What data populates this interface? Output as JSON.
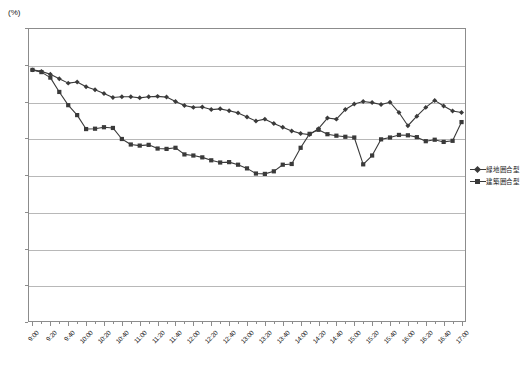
{
  "chart_data": {
    "type": "line",
    "title": "",
    "subtitle": "",
    "unit_label": "(%)",
    "xlabel": "",
    "ylabel": "",
    "ylim": [
      0.0,
      80.0
    ],
    "ytick_step": 10.0,
    "yticks": [
      "0.0",
      "10.0",
      "20.0",
      "30.0",
      "40.0",
      "50.0",
      "60.0",
      "70.0",
      "80.0"
    ],
    "grid": true,
    "grid_axis": "y",
    "legend_position": "right",
    "xtick_labels": [
      "9:00",
      "9:20",
      "9:40",
      "10:00",
      "10:20",
      "10:40",
      "11:00",
      "11:20",
      "11:40",
      "12:00",
      "12:20",
      "12:40",
      "13:00",
      "13:20",
      "13:40",
      "14:00",
      "14:20",
      "14:40",
      "15:00",
      "15:20",
      "15:40",
      "16:00",
      "16:20",
      "16:40",
      "17:00"
    ],
    "x": [
      "9:00",
      "9:10",
      "9:20",
      "9:30",
      "9:40",
      "9:50",
      "10:00",
      "10:10",
      "10:20",
      "10:30",
      "10:40",
      "10:50",
      "11:00",
      "11:10",
      "11:20",
      "11:30",
      "11:40",
      "11:50",
      "12:00",
      "12:10",
      "12:20",
      "12:30",
      "12:40",
      "12:50",
      "13:00",
      "13:10",
      "13:20",
      "13:30",
      "13:40",
      "13:50",
      "14:00",
      "14:10",
      "14:20",
      "14:30",
      "14:40",
      "14:50",
      "15:00",
      "15:10",
      "15:20",
      "15:30",
      "15:40",
      "15:50",
      "16:00",
      "16:10",
      "16:20",
      "16:30",
      "16:40",
      "16:50",
      "17:00"
    ],
    "series": [
      {
        "name": "緑地囲合型",
        "marker": "diamond",
        "color": "#3a3a3a",
        "values": [
          68.6,
          68.2,
          67.4,
          66.2,
          65.0,
          65.3,
          64.0,
          63.2,
          62.2,
          61.1,
          61.3,
          61.3,
          61.0,
          61.3,
          61.4,
          61.2,
          60.0,
          58.9,
          58.4,
          58.5,
          57.8,
          58.0,
          57.5,
          56.9,
          55.8,
          54.7,
          55.2,
          54.0,
          53.0,
          52.0,
          51.3,
          51.0,
          52.6,
          55.5,
          55.2,
          57.8,
          59.3,
          60.0,
          59.7,
          59.2,
          59.8,
          57.0,
          53.4,
          56.0,
          58.4,
          60.3,
          58.8,
          57.4,
          57.0
        ]
      },
      {
        "name": "建築囲合型",
        "marker": "square",
        "color": "#3a3a3a",
        "values": [
          68.6,
          68.0,
          66.5,
          62.6,
          59.0,
          56.3,
          52.5,
          52.6,
          53.0,
          52.8,
          49.8,
          48.3,
          48.0,
          48.2,
          47.2,
          47.1,
          47.4,
          45.6,
          45.3,
          44.8,
          44.0,
          43.4,
          43.5,
          42.8,
          41.8,
          40.4,
          40.3,
          41.0,
          42.8,
          43.0,
          47.4,
          51.2,
          52.3,
          51.1,
          50.7,
          50.4,
          50.2,
          42.9,
          45.3,
          49.7,
          50.2,
          50.9,
          50.8,
          50.3,
          49.2,
          49.6,
          49.0,
          49.3,
          54.4
        ]
      }
    ]
  },
  "legend": {
    "items": [
      {
        "label": "緑地囲合型",
        "marker": "diamond"
      },
      {
        "label": "建築囲合型",
        "marker": "square"
      }
    ]
  }
}
